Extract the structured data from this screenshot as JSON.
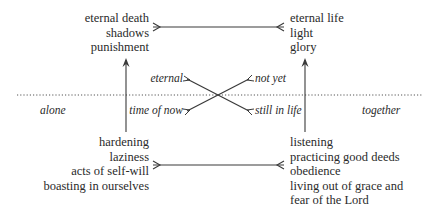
{
  "diagram": {
    "top_left": {
      "items": [
        "eternal death",
        "shadows",
        "punishment"
      ]
    },
    "top_right": {
      "items": [
        "eternal life",
        "light",
        "glory"
      ]
    },
    "bottom_left": {
      "items": [
        "hardening",
        "laziness",
        "acts of self-will",
        "boasting in ourselves"
      ]
    },
    "bottom_right": {
      "items": [
        "listening",
        "practicing good deeds",
        "obedience",
        "living out of grace and",
        "fear of the Lord"
      ]
    },
    "cross_labels": {
      "upper_left": "eternal",
      "upper_right": "not yet",
      "lower_left": "time of now",
      "lower_right": "still in life"
    },
    "side_labels": {
      "left": "alone",
      "right": "together"
    },
    "colors": {
      "line": "#3a3a3a",
      "text": "#2a2a2a"
    }
  }
}
